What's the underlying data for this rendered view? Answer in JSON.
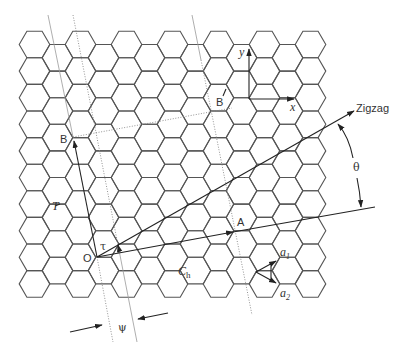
{
  "diagram": {
    "lattice": {
      "origin_x": 34.5,
      "origin_y": 44.5,
      "hex_side": 15.3,
      "row_spacing": 26.6,
      "column_spacing": 23,
      "columns": 13,
      "even_column_rows": 10,
      "odd_column_rows": 9,
      "stroke_color": "#555555"
    },
    "points": {
      "O": {
        "label": "O",
        "x": 97,
        "y": 257
      },
      "A": {
        "label": "A",
        "x": 235,
        "y": 232
      },
      "B_left": {
        "label": "B",
        "x": 73,
        "y": 137
      },
      "B_right": {
        "label": "B",
        "x": 219,
        "y": 106
      }
    },
    "vectors": {
      "chiral": {
        "label_main": "C",
        "label_sub": "h"
      },
      "translation": {
        "label": "T"
      },
      "a1": {
        "label_main": "a",
        "label_sub": "1"
      },
      "a2": {
        "label_main": "a",
        "label_sub": "2"
      },
      "axis_x": {
        "label": "x"
      },
      "axis_y": {
        "label": "y"
      }
    },
    "direction_label": "Zigzag",
    "angles": {
      "theta": "θ",
      "tau": "τ",
      "psi": "ψ"
    }
  }
}
